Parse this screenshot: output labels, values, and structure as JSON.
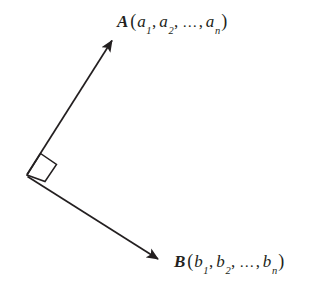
{
  "figure": {
    "background_color": "#ffffff",
    "stroke_color": "#231f20",
    "width": 327,
    "height": 299
  },
  "labels": {
    "vector_a": {
      "name": "A",
      "open_paren": "(",
      "close_paren": ")",
      "components": [
        "a",
        "a",
        "a"
      ],
      "subscripts": [
        "1",
        "2",
        "n"
      ],
      "separator": ",",
      "ellipsis": "…",
      "full_text": "A(a1, a2, … , an)"
    },
    "vector_b": {
      "name": "B",
      "open_paren": "(",
      "close_paren": ")",
      "components": [
        "b",
        "b",
        "b"
      ],
      "subscripts": [
        "1",
        "2",
        "n"
      ],
      "separator": ",",
      "ellipsis": "…",
      "full_text": "B(b1, b2, … , bn)"
    }
  },
  "geometry": {
    "origin": {
      "x": 27,
      "y": 175
    },
    "vector_a_tip": {
      "x": 112,
      "y": 40
    },
    "vector_b_tip": {
      "x": 158,
      "y": 259
    },
    "right_angle_marker": {
      "points": "27,175 40.5,153.5 56.5,164.5 45,181.5",
      "label": "right-angle"
    },
    "stroke_width": 1.6
  }
}
